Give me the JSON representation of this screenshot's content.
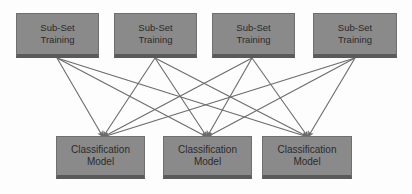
{
  "diagram": {
    "background_color": "#fdfdfd",
    "node_fill_color": "#8a8a8a",
    "node_border_color": "#6f6f6f",
    "node_shadow_color": "#5a5a5a",
    "node_text_color": "#2b2b2b",
    "edge_color": "#6b6b6b",
    "top_row": {
      "label": "Sub-Set Training",
      "nodes": [
        {
          "line1": "Sub-Set",
          "line2": "Training",
          "x": 16,
          "y": 13,
          "w": 83,
          "h": 45,
          "anchor_x": 57,
          "anchor_y": 58
        },
        {
          "line1": "Sub-Set",
          "line2": "Training",
          "x": 114,
          "y": 13,
          "w": 83,
          "h": 45,
          "anchor_x": 155,
          "anchor_y": 58
        },
        {
          "line1": "Sub-Set",
          "line2": "Training",
          "x": 212,
          "y": 13,
          "w": 83,
          "h": 45,
          "anchor_x": 252,
          "anchor_y": 58
        },
        {
          "line1": "Sub-Set",
          "line2": "Training",
          "x": 313,
          "y": 13,
          "w": 84,
          "h": 45,
          "anchor_x": 355,
          "anchor_y": 58
        }
      ]
    },
    "bottom_row": {
      "label": "Classification Model",
      "nodes": [
        {
          "line1": "Classification",
          "line2": "Model",
          "x": 56,
          "y": 136,
          "w": 89,
          "h": 43,
          "anchor_x": 103,
          "anchor_y": 137
        },
        {
          "line1": "Classification",
          "line2": "Model",
          "x": 163,
          "y": 136,
          "w": 89,
          "h": 43,
          "anchor_x": 207,
          "anchor_y": 137
        },
        {
          "line1": "Classification",
          "line2": "Model",
          "x": 262,
          "y": 136,
          "w": 90,
          "h": 43,
          "anchor_x": 308,
          "anchor_y": 137
        }
      ]
    },
    "edges": [
      {
        "from": 0,
        "to": 0
      },
      {
        "from": 0,
        "to": 1
      },
      {
        "from": 0,
        "to": 2
      },
      {
        "from": 1,
        "to": 0
      },
      {
        "from": 1,
        "to": 1
      },
      {
        "from": 1,
        "to": 2
      },
      {
        "from": 2,
        "to": 0
      },
      {
        "from": 2,
        "to": 1
      },
      {
        "from": 2,
        "to": 2
      },
      {
        "from": 3,
        "to": 0
      },
      {
        "from": 3,
        "to": 1
      },
      {
        "from": 3,
        "to": 2
      }
    ]
  }
}
